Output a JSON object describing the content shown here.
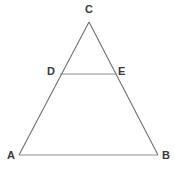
{
  "figure": {
    "type": "geometry-diagram",
    "shape": "triangle-with-midsegment",
    "background_color": "#ffffff",
    "line_color": "#6f6f6f",
    "segment_color": "#8c8c8c",
    "label_color": "#3a3a3a",
    "points": {
      "A": {
        "label": "A",
        "x": 19,
        "y": 155
      },
      "B": {
        "label": "B",
        "x": 158,
        "y": 155
      },
      "C": {
        "label": "C",
        "x": 89,
        "y": 22
      },
      "D": {
        "label": "D",
        "x": 60,
        "y": 74
      },
      "E": {
        "label": "E",
        "x": 117,
        "y": 74
      }
    },
    "segments": [
      {
        "name": "side-AC",
        "from": "A",
        "to": "C"
      },
      {
        "name": "side-CB",
        "from": "C",
        "to": "B"
      },
      {
        "name": "base-AB",
        "from": "A",
        "to": "B"
      },
      {
        "name": "midsegment-DE",
        "from": "D",
        "to": "E"
      }
    ]
  }
}
